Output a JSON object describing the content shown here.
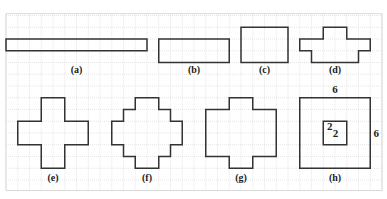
{
  "figure": {
    "grid": {
      "origin_x": 6,
      "origin_y": 15.5,
      "cell": 11.75,
      "cols": 32,
      "rows": 15,
      "line_color": "#d4d4d4"
    },
    "stroke_color": "#333333",
    "shapes": [
      {
        "id": "a",
        "label": "(a)",
        "label_pos": [
          6,
          4.9
        ],
        "points": [
          [
            0,
            2
          ],
          [
            12,
            2
          ],
          [
            12,
            3
          ],
          [
            0,
            3
          ]
        ]
      },
      {
        "id": "b",
        "label": "(b)",
        "label_pos": [
          16,
          4.9
        ],
        "points": [
          [
            13,
            2
          ],
          [
            19,
            2
          ],
          [
            19,
            4
          ],
          [
            13,
            4
          ]
        ]
      },
      {
        "id": "c",
        "label": "(c)",
        "label_pos": [
          22,
          4.9
        ],
        "points": [
          [
            20,
            1
          ],
          [
            24,
            1
          ],
          [
            24,
            4
          ],
          [
            20,
            4
          ]
        ]
      },
      {
        "id": "d",
        "label": "(d)",
        "label_pos": [
          28,
          4.9
        ],
        "points": [
          [
            27,
            1
          ],
          [
            29,
            1
          ],
          [
            29,
            2
          ],
          [
            31,
            2
          ],
          [
            31,
            3
          ],
          [
            30,
            3
          ],
          [
            30,
            4
          ],
          [
            26,
            4
          ],
          [
            26,
            3
          ],
          [
            25,
            3
          ],
          [
            25,
            2
          ],
          [
            27,
            2
          ]
        ]
      },
      {
        "id": "e",
        "label": "(e)",
        "label_pos": [
          4,
          14.1
        ],
        "points": [
          [
            3,
            7
          ],
          [
            5,
            7
          ],
          [
            5,
            9
          ],
          [
            7,
            9
          ],
          [
            7,
            11
          ],
          [
            5,
            11
          ],
          [
            5,
            13
          ],
          [
            3,
            13
          ],
          [
            3,
            11
          ],
          [
            1,
            11
          ],
          [
            1,
            9
          ],
          [
            3,
            9
          ]
        ]
      },
      {
        "id": "f",
        "label": "(f)",
        "label_pos": [
          12,
          14.1
        ],
        "points": [
          [
            11,
            7
          ],
          [
            13,
            7
          ],
          [
            13,
            8
          ],
          [
            14,
            8
          ],
          [
            14,
            9
          ],
          [
            15,
            9
          ],
          [
            15,
            11
          ],
          [
            14,
            11
          ],
          [
            14,
            12
          ],
          [
            13,
            12
          ],
          [
            13,
            13
          ],
          [
            11,
            13
          ],
          [
            11,
            12
          ],
          [
            10,
            12
          ],
          [
            10,
            11
          ],
          [
            9,
            11
          ],
          [
            9,
            9
          ],
          [
            10,
            9
          ],
          [
            10,
            8
          ],
          [
            11,
            8
          ]
        ]
      },
      {
        "id": "g",
        "label": "(g)",
        "label_pos": [
          20,
          14.1
        ],
        "points": [
          [
            19,
            7
          ],
          [
            21,
            7
          ],
          [
            21,
            8
          ],
          [
            23,
            8
          ],
          [
            23,
            12
          ],
          [
            21,
            12
          ],
          [
            21,
            13
          ],
          [
            19,
            13
          ],
          [
            19,
            12
          ],
          [
            17,
            12
          ],
          [
            17,
            8
          ],
          [
            19,
            8
          ]
        ]
      },
      {
        "id": "h",
        "label": "(h)",
        "label_pos": [
          28,
          14.1
        ],
        "points": [
          [
            25,
            7
          ],
          [
            31,
            7
          ],
          [
            31,
            13
          ],
          [
            25,
            13
          ]
        ],
        "inner_points": [
          [
            27,
            9
          ],
          [
            29,
            9
          ],
          [
            29,
            11
          ],
          [
            27,
            11
          ]
        ]
      }
    ],
    "dimensions": [
      {
        "text": "6",
        "pos": [
          28,
          6.6
        ]
      },
      {
        "text": "6",
        "pos": [
          31.5,
          10.3
        ]
      },
      {
        "text": "2",
        "pos": [
          27.55,
          9.75
        ]
      },
      {
        "text": "2",
        "pos": [
          28.05,
          10.3
        ]
      }
    ]
  }
}
